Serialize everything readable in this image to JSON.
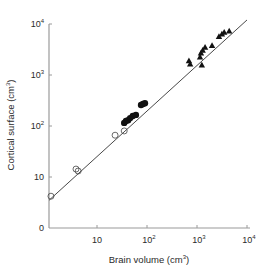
{
  "chart_data": {
    "type": "scatter",
    "title": "",
    "xlabel": "Brain volume (cm",
    "xlabel_sup": "3",
    "xlabel_end": ")",
    "ylabel": "Cortical surface (cm",
    "ylabel_sup": "3",
    "ylabel_end": ")",
    "xscale": "log",
    "yscale": "log",
    "xlim": [
      1,
      10000
    ],
    "ylim": [
      1,
      10000
    ],
    "grid": false,
    "x_ticks": [
      {
        "value": 10,
        "base": "10",
        "exp": ""
      },
      {
        "value": 100,
        "base": "10",
        "exp": "2"
      },
      {
        "value": 1000,
        "base": "10",
        "exp": "3"
      },
      {
        "value": 10000,
        "base": "10",
        "exp": "4"
      }
    ],
    "y_ticks": [
      {
        "value": 1,
        "base": "0",
        "exp": ""
      },
      {
        "value": 10,
        "base": "10",
        "exp": ""
      },
      {
        "value": 100,
        "base": "10",
        "exp": "2"
      },
      {
        "value": 1000,
        "base": "10",
        "exp": "3"
      },
      {
        "value": 10000,
        "base": "10",
        "exp": "4"
      }
    ],
    "fit_line": {
      "x": [
        1.1,
        10000
      ],
      "y": [
        3.5,
        12000
      ]
    },
    "series": [
      {
        "name": "open-circles",
        "marker": "open-circle",
        "points": [
          {
            "x": 1.2,
            "y": 4.2
          },
          {
            "x": 3.8,
            "y": 14.3
          },
          {
            "x": 4.2,
            "y": 13.1
          },
          {
            "x": 23,
            "y": 66
          },
          {
            "x": 35,
            "y": 80
          }
        ]
      },
      {
        "name": "filled-circles",
        "marker": "filled-circle",
        "points": [
          {
            "x": 35,
            "y": 115
          },
          {
            "x": 38,
            "y": 125
          },
          {
            "x": 42,
            "y": 130
          },
          {
            "x": 46,
            "y": 143
          },
          {
            "x": 52,
            "y": 157
          },
          {
            "x": 60,
            "y": 165
          },
          {
            "x": 76,
            "y": 258
          },
          {
            "x": 83,
            "y": 270
          },
          {
            "x": 91,
            "y": 280
          }
        ]
      },
      {
        "name": "triangles",
        "marker": "filled-triangle",
        "points": [
          {
            "x": 690,
            "y": 1900
          },
          {
            "x": 730,
            "y": 1650
          },
          {
            "x": 1150,
            "y": 2250
          },
          {
            "x": 1200,
            "y": 2700
          },
          {
            "x": 1250,
            "y": 1580
          },
          {
            "x": 1300,
            "y": 3050
          },
          {
            "x": 1450,
            "y": 3500
          },
          {
            "x": 2000,
            "y": 3800
          },
          {
            "x": 2750,
            "y": 5700
          },
          {
            "x": 3150,
            "y": 6400
          },
          {
            "x": 3500,
            "y": 6900
          },
          {
            "x": 4400,
            "y": 7300
          }
        ]
      }
    ],
    "colors": {
      "axis": "#9a9a9a",
      "marks": "#111111",
      "text": "#2a2a2a"
    }
  }
}
